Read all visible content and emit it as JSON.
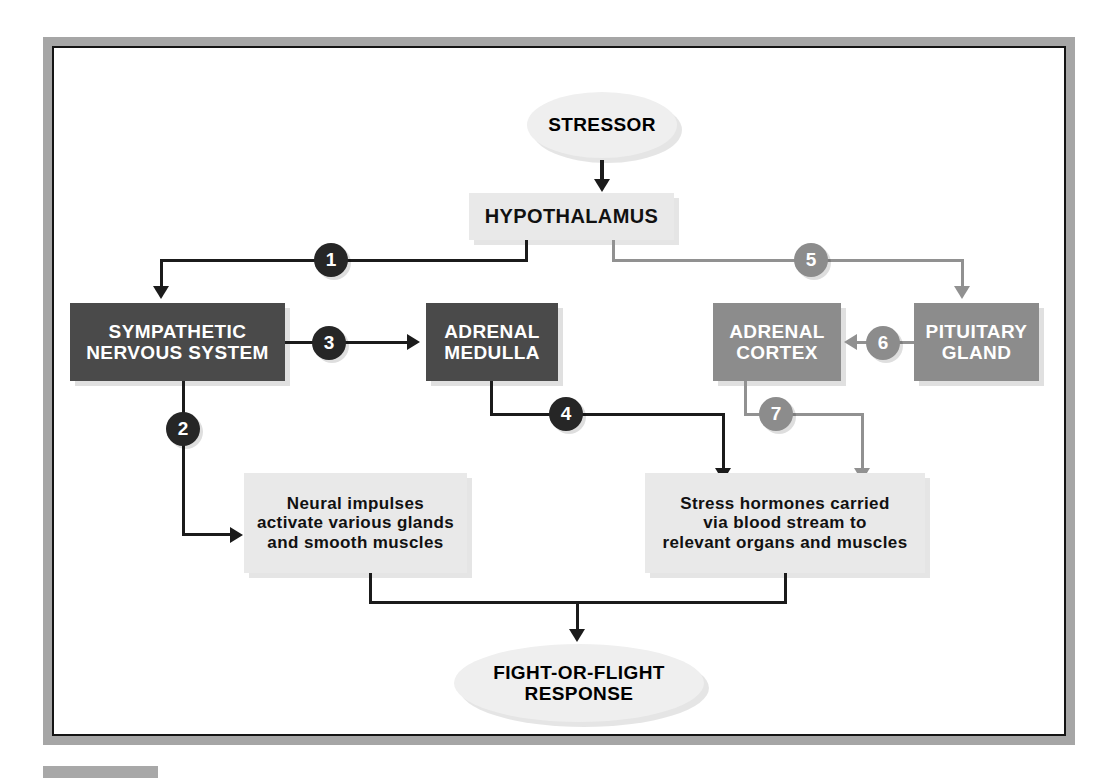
{
  "diagram": {
    "colors": {
      "frame": "#a6a6a6",
      "dark_box": "#4a4a4a",
      "mid_box": "#8c8c8c",
      "light_box": "#e9e9e9",
      "ellipse": "#efefef",
      "dark_badge": "#262626",
      "gray_badge": "#8c8c8c",
      "dark_line": "#1b1b1b",
      "gray_line": "#919191"
    },
    "nodes": {
      "stressor": "STRESSOR",
      "hypothalamus": "HYPOTHALAMUS",
      "sympathetic": "SYMPATHETIC\nNERVOUS SYSTEM",
      "sympathetic_line1": "SYMPATHETIC",
      "sympathetic_line2": "NERVOUS SYSTEM",
      "adrenal_medulla_line1": "ADRENAL",
      "adrenal_medulla_line2": "MEDULLA",
      "adrenal_cortex_line1": "ADRENAL",
      "adrenal_cortex_line2": "CORTEX",
      "pituitary_line1": "PITUITARY",
      "pituitary_line2": "GLAND",
      "neural_impulses_line1": "Neural impulses",
      "neural_impulses_line2": "activate various glands",
      "neural_impulses_line3": "and smooth muscles",
      "stress_hormones_line1": "Stress hormones carried",
      "stress_hormones_line2": "via blood stream to",
      "stress_hormones_line3": "relevant organs and muscles",
      "fight_or_flight_line1": "FIGHT-OR-FLIGHT",
      "fight_or_flight_line2": "RESPONSE"
    },
    "badges": [
      {
        "id": "1",
        "label": "1",
        "style": "dark"
      },
      {
        "id": "2",
        "label": "2",
        "style": "dark"
      },
      {
        "id": "3",
        "label": "3",
        "style": "dark"
      },
      {
        "id": "4",
        "label": "4",
        "style": "dark"
      },
      {
        "id": "5",
        "label": "5",
        "style": "gray"
      },
      {
        "id": "6",
        "label": "6",
        "style": "gray"
      },
      {
        "id": "7",
        "label": "7",
        "style": "gray"
      }
    ]
  }
}
